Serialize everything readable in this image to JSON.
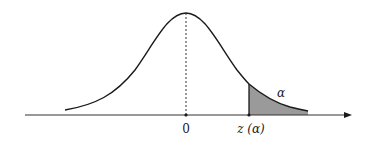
{
  "figure": {
    "type": "normal-distribution-upper-tail",
    "labels": {
      "mean": "0",
      "critical_value": "z (α)",
      "tail_area": "α"
    },
    "colors": {
      "curve": "#1a1a1a",
      "axis": "#333333",
      "shade": "#9a9a9a",
      "dashed_line": "#333333"
    }
  }
}
